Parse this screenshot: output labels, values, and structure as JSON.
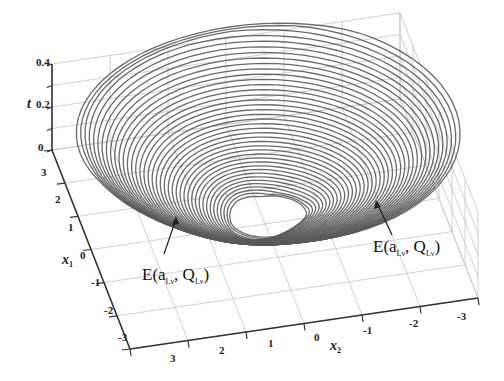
{
  "chart_data": {
    "type": "3d-surface-curves",
    "title": "",
    "axes": {
      "z": {
        "label": "t",
        "ticks": [
          "0",
          "0.2",
          "0.4"
        ],
        "range": [
          0,
          0.4
        ]
      },
      "x1": {
        "label": "x",
        "label_sub": "1",
        "ticks": [
          "3",
          "2",
          "1",
          "0",
          "-1",
          "-2",
          "-3"
        ],
        "range": [
          -3,
          3
        ]
      },
      "x2": {
        "label": "x",
        "label_sub": "2",
        "ticks": [
          "3",
          "2",
          "1",
          "0",
          "-1",
          "-2",
          "-3"
        ],
        "range": [
          -3,
          3
        ]
      }
    },
    "grid": true,
    "annotations": [
      {
        "text_main": "E(a",
        "sub1": "Lν",
        "text_mid": ", Q",
        "sub2": "Lν",
        "text_end": ")",
        "position": "lower-left"
      },
      {
        "text_main": "E(a",
        "sub1": "Lν",
        "text_mid": ", Q",
        "sub2": "Lν",
        "text_end": ")",
        "position": "lower-right"
      }
    ],
    "series": [
      {
        "name": "level-set trajectories",
        "count": 40,
        "t_min": 0.0,
        "t_max": 0.4,
        "radius_min": 0.6,
        "radius_max": 3.0
      }
    ]
  },
  "labels": {
    "z_label": "t",
    "x1_label": "x",
    "x1_sub": "1",
    "x2_label": "x",
    "x2_sub": "2",
    "z_ticks": [
      "0.4",
      "0.2",
      "0"
    ],
    "x1_ticks": [
      "3",
      "2",
      "1",
      "0",
      "-1",
      "-2",
      "-3"
    ],
    "x2_ticks": [
      "3",
      "2",
      "1",
      "0",
      "-1",
      "-2",
      "-3"
    ],
    "annot_left": {
      "E": "E(a",
      "s1": "Lν",
      "mid": ", Q",
      "s2": "Lν",
      "end": ")"
    },
    "annot_right": {
      "E": "E(a",
      "s1": "Lν",
      "mid": ", Q",
      "s2": "Lν",
      "end": ")"
    }
  }
}
